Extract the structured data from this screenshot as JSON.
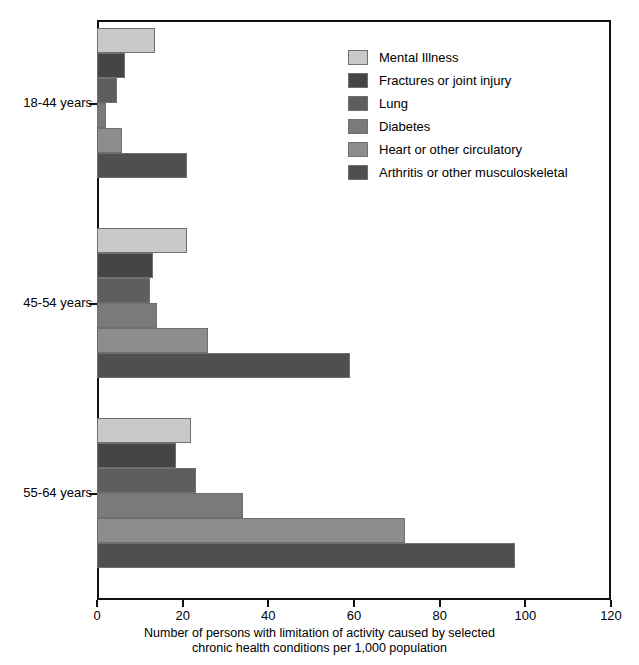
{
  "chart_data": {
    "type": "bar",
    "orientation": "horizontal",
    "title": "",
    "xlabel": "Number of persons with limitation of activity caused by selected chronic health conditions per 1,000 population",
    "xlabel_lines": [
      "Number of persons with limitation of activity caused by selected",
      "chronic health conditions per 1,000 population"
    ],
    "ylabel": "",
    "categories": [
      "18-44 years",
      "45-54 years",
      "55-64 years"
    ],
    "xlim": [
      0,
      120
    ],
    "xticks": [
      0,
      20,
      40,
      60,
      80,
      100,
      120
    ],
    "xtick_labels": [
      "0",
      "20",
      "40",
      "60",
      "80",
      "100",
      "120"
    ],
    "grid": false,
    "legend_position": "upper right",
    "series": [
      {
        "name": "Mental Illness",
        "color": "#c9c9c9",
        "values": [
          13.5,
          21.0,
          22.0
        ]
      },
      {
        "name": "Fractures or joint injury",
        "color": "#454545",
        "values": [
          6.5,
          13.0,
          18.5
        ]
      },
      {
        "name": "Lung",
        "color": "#5e5e5e",
        "values": [
          4.7,
          12.4,
          23.0
        ]
      },
      {
        "name": "Diabetes",
        "color": "#7a7a7a",
        "values": [
          2.0,
          14.0,
          34.0
        ]
      },
      {
        "name": "Heart or other circulatory",
        "color": "#8d8d8d",
        "values": [
          5.8,
          26.0,
          72.0
        ]
      },
      {
        "name": "Arthritis or other musculoskeletal",
        "color": "#4f4f4f",
        "values": [
          21.0,
          59.0,
          97.5
        ]
      }
    ]
  },
  "legend": {
    "items": [
      {
        "label": "Mental Illness"
      },
      {
        "label": "Fractures or joint injury"
      },
      {
        "label": "Lung"
      },
      {
        "label": "Diabetes"
      },
      {
        "label": "Heart or other circulatory"
      },
      {
        "label": "Arthritis or other musculoskeletal"
      }
    ]
  }
}
